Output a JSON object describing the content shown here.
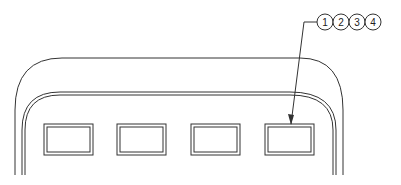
{
  "diagram": {
    "type": "technical-drawing",
    "balloons": [
      "1",
      "2",
      "3",
      "4"
    ],
    "buttons_count": 4,
    "stroke_color": "#333333",
    "background": "#ffffff"
  }
}
